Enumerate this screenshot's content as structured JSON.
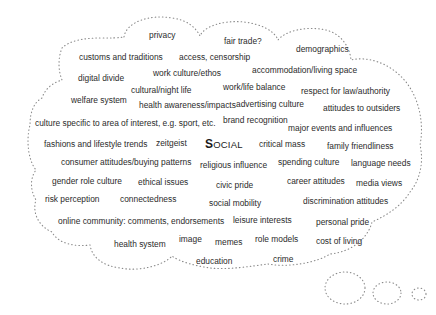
{
  "diagram": {
    "type": "thought-cloud",
    "center_label": {
      "first_letter": "S",
      "rest": "OCIAL",
      "full": "SOCIAL"
    },
    "outline_color": "#888888",
    "outline_style": "dotted",
    "words": [
      {
        "text": "privacy",
        "x": 149,
        "y": 31
      },
      {
        "text": "fair trade?",
        "x": 224,
        "y": 37
      },
      {
        "text": "demographics",
        "x": 296,
        "y": 45
      },
      {
        "text": "customs and traditions",
        "x": 79,
        "y": 53
      },
      {
        "text": "access, censorship",
        "x": 179,
        "y": 53
      },
      {
        "text": "digital divide",
        "x": 78,
        "y": 74
      },
      {
        "text": "work culture/ethos",
        "x": 153,
        "y": 69
      },
      {
        "text": "accommodation/living space",
        "x": 252,
        "y": 66
      },
      {
        "text": "cultural/night life",
        "x": 131,
        "y": 86
      },
      {
        "text": "work/life balance",
        "x": 223,
        "y": 83
      },
      {
        "text": "respect for law/authority",
        "x": 301,
        "y": 87
      },
      {
        "text": "welfare system",
        "x": 71,
        "y": 96
      },
      {
        "text": "health awareness/impacts",
        "x": 139,
        "y": 101
      },
      {
        "text": "advertising culture",
        "x": 236,
        "y": 100
      },
      {
        "text": "attitudes to outsiders",
        "x": 323,
        "y": 104
      },
      {
        "text": "culture specific to area of interest, e.g. sport, etc.",
        "x": 35,
        "y": 119
      },
      {
        "text": "brand recognition",
        "x": 223,
        "y": 116
      },
      {
        "text": "major events and influences",
        "x": 288,
        "y": 124
      },
      {
        "text": "fashions and lifestyle trends",
        "x": 44,
        "y": 140
      },
      {
        "text": "zeitgeist",
        "x": 156,
        "y": 139
      },
      {
        "text": "critical mass",
        "x": 259,
        "y": 140
      },
      {
        "text": "family friendliness",
        "x": 327,
        "y": 142
      },
      {
        "text": "consumer attitudes/buying patterns",
        "x": 61,
        "y": 158
      },
      {
        "text": "religious influence",
        "x": 200,
        "y": 161
      },
      {
        "text": "spending culture",
        "x": 278,
        "y": 158
      },
      {
        "text": "language needs",
        "x": 351,
        "y": 159
      },
      {
        "text": "gender role culture",
        "x": 52,
        "y": 177
      },
      {
        "text": "ethical issues",
        "x": 138,
        "y": 178
      },
      {
        "text": "civic pride",
        "x": 216,
        "y": 181
      },
      {
        "text": "career attitudes",
        "x": 287,
        "y": 177
      },
      {
        "text": "media views",
        "x": 356,
        "y": 179
      },
      {
        "text": "risk perception",
        "x": 45,
        "y": 195
      },
      {
        "text": "connectedness",
        "x": 120,
        "y": 195
      },
      {
        "text": "social mobility",
        "x": 209,
        "y": 199
      },
      {
        "text": "discrimination attitudes",
        "x": 303,
        "y": 197
      },
      {
        "text": "online community: comments, endorsements",
        "x": 58,
        "y": 217
      },
      {
        "text": "leisure interests",
        "x": 233,
        "y": 216
      },
      {
        "text": "personal pride",
        "x": 316,
        "y": 218
      },
      {
        "text": "health system",
        "x": 114,
        "y": 240
      },
      {
        "text": "image",
        "x": 179,
        "y": 235
      },
      {
        "text": "memes",
        "x": 215,
        "y": 238
      },
      {
        "text": "role models",
        "x": 255,
        "y": 235
      },
      {
        "text": "cost of  living",
        "x": 316,
        "y": 237
      },
      {
        "text": "education",
        "x": 196,
        "y": 257
      },
      {
        "text": "crime",
        "x": 273,
        "y": 255
      }
    ],
    "center_position": {
      "x": 205,
      "y": 138
    }
  }
}
